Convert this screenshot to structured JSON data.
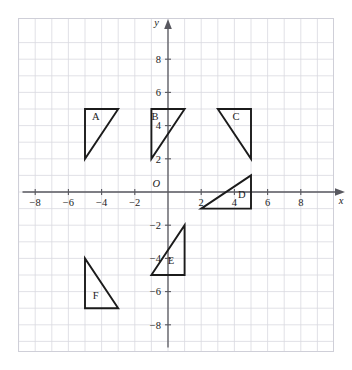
{
  "artifact": {
    "top_edge_text": "· · · · · · · · · · · ·"
  },
  "chart_data": {
    "type": "scatter",
    "title": "",
    "xlabel": "x",
    "ylabel": "y",
    "origin_label": "O",
    "xlim": [
      -9,
      9
    ],
    "ylim": [
      -9,
      9
    ],
    "grid": true,
    "grid_step": 1,
    "tick_step": 2,
    "legend": "none",
    "xticks": [
      -8,
      -6,
      -4,
      -2,
      2,
      4,
      6,
      8
    ],
    "xtick_labels": [
      "−8",
      "−6",
      "−4",
      "−2",
      "2",
      "4",
      "6",
      "8"
    ],
    "yticks": [
      8,
      6,
      4,
      2,
      -2,
      -4,
      -6,
      -8
    ],
    "ytick_labels": [
      "8",
      "6",
      "4",
      "2",
      "−2",
      "−4",
      "−6",
      "−8"
    ],
    "shapes": [
      {
        "label": "A",
        "kind": "right-triangle",
        "right_angle_at": "top-left",
        "vertices": [
          [
            -5,
            5
          ],
          [
            -3,
            5
          ],
          [
            -5,
            2
          ]
        ],
        "label_point": [
          -4.35,
          4.35
        ]
      },
      {
        "label": "B",
        "kind": "right-triangle",
        "right_angle_at": "top-left",
        "vertices": [
          [
            -1,
            5
          ],
          [
            1,
            5
          ],
          [
            -1,
            2
          ]
        ],
        "label_point": [
          -0.78,
          4.35
        ]
      },
      {
        "label": "C",
        "kind": "right-triangle",
        "right_angle_at": "top-right",
        "vertices": [
          [
            3,
            5
          ],
          [
            5,
            5
          ],
          [
            5,
            2
          ]
        ],
        "label_point": [
          4.1,
          4.35
        ]
      },
      {
        "label": "D",
        "kind": "right-triangle",
        "right_angle_at": "bottom-right",
        "vertices": [
          [
            2,
            -1
          ],
          [
            5,
            -1
          ],
          [
            5,
            1
          ]
        ],
        "label_point": [
          4.45,
          -0.35
        ]
      },
      {
        "label": "E",
        "kind": "right-triangle",
        "right_angle_at": "bottom-right",
        "vertices": [
          [
            -1,
            -5
          ],
          [
            1,
            -5
          ],
          [
            1,
            -2
          ]
        ],
        "label_point": [
          0.18,
          -4.35
        ]
      },
      {
        "label": "F",
        "kind": "right-triangle",
        "right_angle_at": "bottom-left",
        "vertices": [
          [
            -5,
            -7
          ],
          [
            -5,
            -4
          ],
          [
            -3,
            -7
          ]
        ],
        "label_point": [
          -4.35,
          -6.45
        ]
      }
    ]
  }
}
